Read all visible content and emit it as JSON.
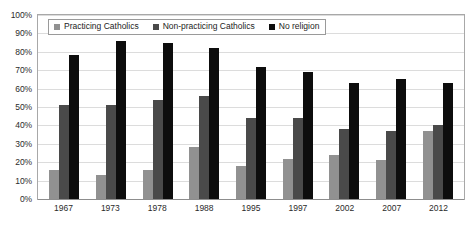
{
  "chart_data": {
    "type": "bar",
    "title": "",
    "subtitle": "",
    "xlabel": "",
    "ylabel": "",
    "ylim": [
      0,
      100
    ],
    "grid": true,
    "legend_position": "top-left",
    "categories": [
      "1967",
      "1973",
      "1978",
      "1988",
      "1995",
      "1997",
      "2002",
      "2007",
      "2012"
    ],
    "series": [
      {
        "name": "Practicing Catholics",
        "color": "#919191",
        "values": [
          16,
          13,
          16,
          28,
          18,
          22,
          24,
          21,
          37
        ]
      },
      {
        "name": "Non-practicing Catholics",
        "color": "#4a4a4a",
        "values": [
          51,
          51,
          54,
          56,
          44,
          44,
          38,
          37,
          40
        ]
      },
      {
        "name": "No religion",
        "color": "#0d0d0d",
        "values": [
          78,
          86,
          85,
          82,
          72,
          69,
          63,
          65,
          63
        ]
      }
    ],
    "y_tick_labels": [
      "100%",
      "90%",
      "80%",
      "70%",
      "60%",
      "50%",
      "40%",
      "30%",
      "20%",
      "10%",
      "0%"
    ],
    "y_tick_values": [
      100,
      90,
      80,
      70,
      60,
      50,
      40,
      30,
      20,
      10,
      0
    ]
  },
  "legend": {
    "items": [
      {
        "label": "Practicing Catholics"
      },
      {
        "label": "Non-practicing Catholics"
      },
      {
        "label": "No religion"
      }
    ]
  }
}
